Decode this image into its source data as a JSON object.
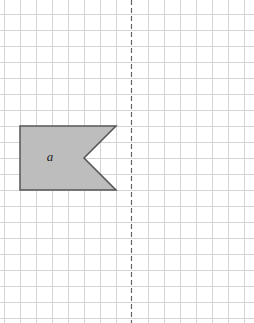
{
  "diagram": {
    "type": "grid-reflection",
    "grid": {
      "cell_size_px": 16,
      "origin_x": 4,
      "origin_y": 14,
      "line_color": "#d4d4d4",
      "background": "#ffffff"
    },
    "mirror_line": {
      "style": "dashed",
      "x": 131,
      "color": "#666666"
    },
    "shape": {
      "label": "a",
      "fill": "#bdbdbd",
      "stroke": "#555555",
      "points": [
        [
          20,
          126
        ],
        [
          116,
          126
        ],
        [
          84,
          158
        ],
        [
          116,
          190
        ],
        [
          20,
          190
        ]
      ],
      "label_position": [
        50,
        161
      ]
    }
  }
}
